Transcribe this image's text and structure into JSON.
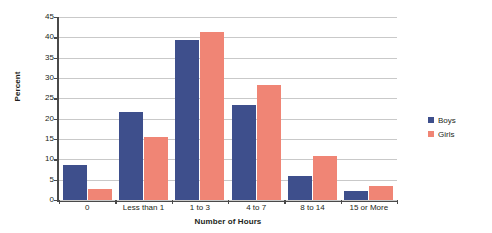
{
  "chart_data": {
    "type": "bar",
    "title": "",
    "xlabel": "Number of Hours",
    "ylabel": "Percent",
    "categories": [
      "0",
      "Less than 1",
      "1 to 3",
      "4 to 7",
      "8 to 14",
      "15 or More"
    ],
    "series": [
      {
        "name": "Boys",
        "color": "#3e4f8c",
        "values": [
          8.6,
          21.7,
          39.4,
          23.4,
          5.8,
          2.2
        ]
      },
      {
        "name": "Girls",
        "color": "#f08575",
        "values": [
          2.7,
          15.5,
          41.2,
          28.4,
          10.8,
          3.5
        ]
      }
    ],
    "ylim": [
      0,
      45
    ],
    "ytick_step": 5,
    "yticks": [
      "45",
      "40",
      "35",
      "30",
      "25",
      "20",
      "15",
      "10",
      "5",
      "0"
    ],
    "grid": true,
    "grid_axis": "y",
    "legend_position": "right",
    "axis_color": "#4a4a4a",
    "grid_color": "#c9c9c9",
    "background": "#ffffff"
  },
  "legend": {
    "entries": [
      {
        "label": "Boys",
        "swatch": "boys-legend-swatch"
      },
      {
        "label": "Girls",
        "swatch": "girls-legend-swatch"
      }
    ]
  }
}
